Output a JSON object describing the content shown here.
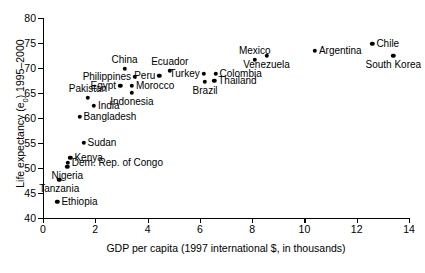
{
  "chart_data": {
    "type": "scatter",
    "title": "",
    "xlabel": "GDP per capita (1997 international $, in thousands)",
    "ylabel": "Life expectancy (e0) 1995–2000",
    "xlim": [
      0,
      14
    ],
    "ylim": [
      40,
      80
    ],
    "xticks": [
      0,
      2,
      4,
      6,
      8,
      10,
      12,
      14
    ],
    "yticks": [
      40,
      45,
      50,
      55,
      60,
      65,
      70,
      75,
      80
    ],
    "grid": false,
    "legend": "none",
    "points": [
      {
        "name": "Ethiopia",
        "x": 0.55,
        "y": 43.2,
        "label_pos": "right"
      },
      {
        "name": "Tanzania",
        "x": 0.62,
        "y": 47.7,
        "label_pos": "below"
      },
      {
        "name": "Nigeria",
        "x": 0.93,
        "y": 50.3,
        "label_pos": "below"
      },
      {
        "name": "Dem. Rep. of Congo",
        "x": 0.95,
        "y": 51.0,
        "label_pos": "right"
      },
      {
        "name": "Kenya",
        "x": 1.05,
        "y": 52.1,
        "label_pos": "right"
      },
      {
        "name": "Sudan",
        "x": 1.55,
        "y": 55.0,
        "label_pos": "right"
      },
      {
        "name": "Bangladesh",
        "x": 1.4,
        "y": 60.3,
        "label_pos": "right"
      },
      {
        "name": "India",
        "x": 1.95,
        "y": 62.5,
        "label_pos": "right"
      },
      {
        "name": "Pakistan",
        "x": 1.72,
        "y": 64.0,
        "label_pos": "above"
      },
      {
        "name": "Indonesia",
        "x": 3.4,
        "y": 65.1,
        "label_pos": "below"
      },
      {
        "name": "Egypt",
        "x": 2.95,
        "y": 66.5,
        "label_pos": "left"
      },
      {
        "name": "Morocco",
        "x": 3.4,
        "y": 66.5,
        "label_pos": "right"
      },
      {
        "name": "Philippines",
        "x": 3.52,
        "y": 68.3,
        "label_pos": "left"
      },
      {
        "name": "China",
        "x": 3.12,
        "y": 69.9,
        "label_pos": "above"
      },
      {
        "name": "Peru",
        "x": 4.45,
        "y": 68.4,
        "label_pos": "left"
      },
      {
        "name": "Ecuador",
        "x": 4.85,
        "y": 69.5,
        "label_pos": "above"
      },
      {
        "name": "Brazil",
        "x": 6.2,
        "y": 67.2,
        "label_pos": "below"
      },
      {
        "name": "Turkey",
        "x": 6.15,
        "y": 68.9,
        "label_pos": "left"
      },
      {
        "name": "Thailand",
        "x": 6.55,
        "y": 67.5,
        "label_pos": "right"
      },
      {
        "name": "Colombia",
        "x": 6.6,
        "y": 68.9,
        "label_pos": "right"
      },
      {
        "name": "Mexico",
        "x": 8.1,
        "y": 71.7,
        "label_pos": "above"
      },
      {
        "name": "Venezuela",
        "x": 8.55,
        "y": 72.5,
        "label_pos": "below"
      },
      {
        "name": "Argentina",
        "x": 10.4,
        "y": 73.5,
        "label_pos": "right"
      },
      {
        "name": "Chile",
        "x": 12.6,
        "y": 74.8,
        "label_pos": "right"
      },
      {
        "name": "South Korea",
        "x": 13.4,
        "y": 72.4,
        "label_pos": "below"
      }
    ]
  }
}
